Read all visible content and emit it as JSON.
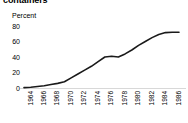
{
  "title": "containers",
  "axes": {
    "y_label": "Percent",
    "y_ticks": [
      "80",
      "60",
      "40",
      "20",
      "0"
    ],
    "x_ticks": [
      "1964",
      "1966",
      "1968",
      "1970",
      "1972",
      "1974",
      "1976",
      "1978",
      "1980",
      "1982",
      "1984",
      "1986"
    ]
  },
  "colors": {
    "line": "#1a1a1a",
    "baseline": "#d8d8d8",
    "text": "#000000",
    "background": "#ffffff"
  },
  "chart_data": {
    "type": "line",
    "title": "containers",
    "xlabel": "",
    "ylabel": "Percent",
    "ylim": [
      0,
      80
    ],
    "xlim": [
      1964,
      1987
    ],
    "grid": false,
    "legend": "none",
    "x": [
      1964,
      1965,
      1966,
      1967,
      1968,
      1969,
      1970,
      1971,
      1972,
      1973,
      1974,
      1975,
      1976,
      1977,
      1978,
      1979,
      1980,
      1981,
      1982,
      1983,
      1984,
      1985,
      1986,
      1987
    ],
    "series": [
      {
        "name": "containers",
        "values": [
          0.5,
          1,
          2,
          3,
          4.5,
          6,
          8,
          13,
          18,
          23,
          28,
          34,
          40,
          41,
          40,
          44,
          49,
          55,
          60,
          65,
          69,
          71.5,
          72,
          72
        ]
      }
    ]
  }
}
